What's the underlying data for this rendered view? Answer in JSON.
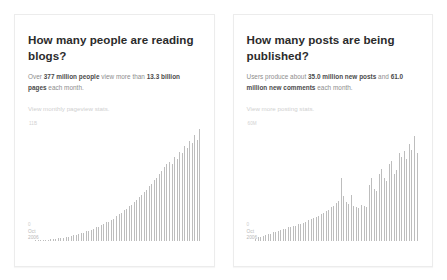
{
  "page": {
    "background": "#ffffff",
    "card_border_color": "#ececec",
    "bar_color": "#bdbdbd",
    "title_color": "#2b2b2b",
    "body_color": "#8d8d8d",
    "link_color": "#cfcfcf"
  },
  "cards": [
    {
      "title": "How many people are reading blogs?",
      "desc_parts": {
        "p1": "Over ",
        "b1": "377 million people",
        "p2": " view more than ",
        "b2": "13.3 billion pages",
        "p3": " each month."
      },
      "link": "View monthly pageview stats.",
      "y_label": "11B",
      "axis_zero": "0",
      "axis_x": "Oct\n2006"
    },
    {
      "title": "How many posts are being published?",
      "desc_parts": {
        "p1": "Users produce about ",
        "b1": "35.0 million new posts",
        "p2": " and ",
        "b2": "61.0 million new comments",
        "p3": " each month."
      },
      "link": "View more posting stats.",
      "y_label": "60M",
      "axis_zero": "0",
      "axis_x": "Oct\n2006"
    }
  ],
  "chart_data": [
    {
      "type": "bar",
      "title": "How many people are reading blogs?",
      "xlabel": "Oct 2006",
      "ylabel": "Pageviews",
      "ylim": [
        0,
        11
      ],
      "y_top_tick": "11B",
      "y_zero_tick": "0",
      "grid": false,
      "legend": "none",
      "unit": "billion pageviews per month",
      "x_start": "Oct 2006",
      "values": [
        0.05,
        0.06,
        0.07,
        0.08,
        0.09,
        0.1,
        0.11,
        0.13,
        0.14,
        0.16,
        0.18,
        0.2,
        0.22,
        0.24,
        0.26,
        0.29,
        0.31,
        0.34,
        0.37,
        0.4,
        0.44,
        0.47,
        0.51,
        0.55,
        0.59,
        0.63,
        0.68,
        0.73,
        0.78,
        0.83,
        0.88,
        0.94,
        1.0,
        1.06,
        1.12,
        1.19,
        1.26,
        1.33,
        1.4,
        1.48,
        1.56,
        1.64,
        1.73,
        1.82,
        1.91,
        2.0,
        2.1,
        2.2,
        2.31,
        2.42,
        2.53,
        2.64,
        2.76,
        2.88,
        3.01,
        3.14,
        3.27,
        3.41,
        3.55,
        3.7,
        3.85,
        4.0,
        4.16,
        4.32,
        4.49,
        4.66,
        4.84,
        5.02,
        5.2,
        5.39,
        5.58,
        5.78,
        5.98,
        6.19,
        6.4,
        6.62,
        6.84,
        7.06,
        7.29,
        7.53,
        7.25,
        7.77,
        8.02,
        7.6,
        8.27,
        8.53,
        8.1,
        8.79,
        9.05,
        8.6,
        9.32,
        9.59,
        9.1,
        9.87,
        10.15,
        9.6,
        10.43,
        10.72,
        9.9,
        11.0
      ]
    },
    {
      "type": "bar",
      "title": "How many posts are being published?",
      "xlabel": "Oct 2006",
      "ylabel": "New posts",
      "ylim": [
        0,
        60
      ],
      "y_top_tick": "60M",
      "y_zero_tick": "0",
      "grid": false,
      "legend": "none",
      "unit": "million new posts per month",
      "x_start": "Oct 2006",
      "values": [
        1.0,
        1.3,
        1.6,
        1.9,
        2.2,
        2.5,
        2.8,
        3.1,
        3.4,
        3.7,
        4.0,
        4.3,
        4.6,
        4.9,
        5.2,
        5.5,
        5.8,
        6.1,
        6.4,
        6.7,
        7.0,
        7.3,
        7.6,
        8.5,
        8.0,
        8.3,
        8.6,
        8.9,
        9.2,
        9.5,
        9.8,
        10.2,
        10.6,
        11.0,
        11.4,
        11.8,
        12.2,
        12.6,
        13.0,
        13.5,
        14.0,
        14.5,
        15.0,
        15.6,
        16.2,
        16.8,
        17.4,
        18.0,
        18.8,
        19.6,
        20.4,
        21.2,
        22.0,
        34.0,
        24.0,
        22.5,
        21.0,
        20.0,
        19.5,
        24.5,
        19.0,
        18.5,
        18.0,
        17.5,
        18.5,
        19.5,
        20.5,
        19.0,
        18.0,
        22.0,
        30.0,
        33.5,
        31.0,
        28.0,
        27.0,
        33.0,
        36.0,
        38.5,
        37.0,
        34.0,
        32.0,
        38.0,
        41.0,
        43.0,
        40.0,
        36.0,
        38.0,
        44.0,
        47.0,
        45.0,
        55.0,
        48.0,
        44.0,
        57.5,
        52.0,
        49.0,
        53.0,
        56.0,
        51.0,
        47.0
      ]
    }
  ]
}
